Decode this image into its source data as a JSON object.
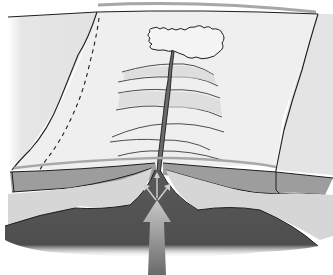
{
  "diagram": {
    "colors": {
      "background": "#ffffff",
      "surface_light": "#ececec",
      "surface_shaded": "#dcdcdc",
      "sea_line": "#a8a8a8",
      "crust_band": "#9a9a9a",
      "lithosphere_light": "#d6d6d6",
      "mantle_dark": "#555555",
      "rift_fill": "#6a6a6a",
      "arrow": "#a0a0a0",
      "outline": "#1e1e1e"
    },
    "elements": [
      {
        "name": "island",
        "label": ""
      },
      {
        "name": "rift-valley",
        "label": ""
      },
      {
        "name": "transform-faults",
        "count": 6
      },
      {
        "name": "upwelling-arrow",
        "label": ""
      },
      {
        "name": "spreading-arrows",
        "count": 3
      }
    ]
  }
}
